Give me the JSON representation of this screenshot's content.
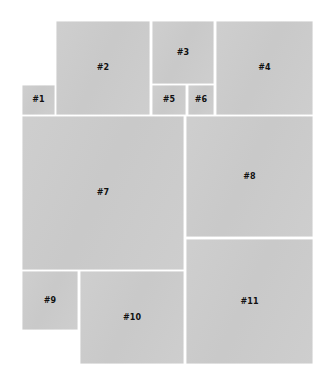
{
  "figure": {
    "kind": "rectangle-packing-diagram",
    "background_color": "#ffffff",
    "block_fill_color": "#cccccc",
    "gutter_color": "#ffffff",
    "label_color": "#111111",
    "canvas_width": 331,
    "canvas_height": 380,
    "block_count": 11
  },
  "blocks": [
    {
      "label": "#1",
      "x": 22,
      "y": 85,
      "w": 33,
      "h": 30
    },
    {
      "label": "#2",
      "x": 56,
      "y": 21,
      "w": 94,
      "h": 94
    },
    {
      "label": "#3",
      "x": 152,
      "y": 21,
      "w": 62,
      "h": 63
    },
    {
      "label": "#4",
      "x": 216,
      "y": 21,
      "w": 97,
      "h": 94
    },
    {
      "label": "#5",
      "x": 152,
      "y": 85,
      "w": 34,
      "h": 30
    },
    {
      "label": "#6",
      "x": 188,
      "y": 85,
      "w": 26,
      "h": 30
    },
    {
      "label": "#7",
      "x": 22,
      "y": 116,
      "w": 162,
      "h": 154
    },
    {
      "label": "#8",
      "x": 186,
      "y": 116,
      "w": 127,
      "h": 121
    },
    {
      "label": "#9",
      "x": 22,
      "y": 271,
      "w": 56,
      "h": 59
    },
    {
      "label": "#10",
      "x": 80,
      "y": 271,
      "w": 104,
      "h": 93
    },
    {
      "label": "#11",
      "x": 186,
      "y": 239,
      "w": 127,
      "h": 125
    }
  ]
}
